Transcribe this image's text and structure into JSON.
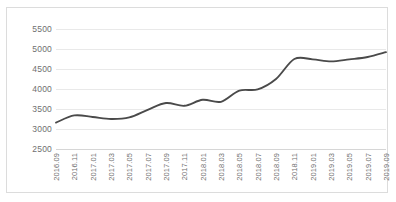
{
  "chart_data": {
    "type": "line",
    "title": "",
    "subtitle": "",
    "xlabel": "",
    "ylabel": "",
    "legend": [],
    "legend_position": "none",
    "grid": true,
    "ylim": [
      2500,
      5500
    ],
    "yticks": [
      2500,
      3000,
      3500,
      4000,
      4500,
      5000,
      5500
    ],
    "ytick_labels": [
      "2500",
      "3000",
      "3500",
      "4000",
      "4500",
      "5000",
      "5500"
    ],
    "categories": [
      "2016.09",
      "2016.11",
      "2017.01",
      "2017.03",
      "2017.05",
      "2017.07",
      "2017.09",
      "2017.11",
      "2018.01",
      "2018.03",
      "2018.05",
      "2018.07",
      "2018.09",
      "2018.11",
      "2019.01",
      "2019.03",
      "2019.05",
      "2019.07",
      "2019.09"
    ],
    "values": [
      3160,
      3340,
      3300,
      3250,
      3290,
      3480,
      3650,
      3580,
      3730,
      3680,
      3960,
      3990,
      4250,
      4750,
      4740,
      4690,
      4740,
      4800,
      4920
    ],
    "series": [
      {
        "name": "",
        "color": "#4a4a4a",
        "values": [
          3160,
          3340,
          3300,
          3250,
          3290,
          3480,
          3650,
          3580,
          3730,
          3680,
          3960,
          3990,
          4250,
          4750,
          4740,
          4690,
          4740,
          4800,
          4920
        ]
      }
    ],
    "colors": {
      "line": "#4a4a4a",
      "grid": "#e9e9e9",
      "axis": "#d6d6d6",
      "tick_text": "#6f6f6f",
      "border": "#dcdcdc",
      "background": "#ffffff"
    }
  }
}
